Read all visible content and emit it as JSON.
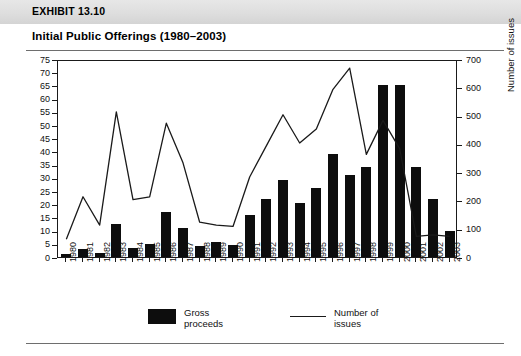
{
  "header": {
    "exhibit_label": "EXHIBIT 13.10",
    "title": "Initial Public Offerings (1980–2003)"
  },
  "legend": {
    "bars_label": "Gross proceeds",
    "bars_label_line1": "Gross",
    "bars_label_line2": "proceeds",
    "line_label": "Number of issues",
    "line_label_line1": "Number of",
    "line_label_line2": "issues",
    "bar_color": "#0d0d0d",
    "line_color": "#1a1a1a"
  },
  "footer": {
    "source": ""
  },
  "chart_data": {
    "type": "bar",
    "title": "Initial Public Offerings (1980–2003)",
    "xlabel": "",
    "ylabel": "Volumes ($ billions)",
    "y2label": "Number of issues",
    "ylim": [
      0,
      75
    ],
    "y2lim": [
      0,
      700
    ],
    "yticks": [
      0,
      5,
      10,
      15,
      20,
      25,
      30,
      35,
      40,
      45,
      50,
      55,
      60,
      65,
      70,
      75
    ],
    "y2ticks": [
      0,
      100,
      200,
      300,
      400,
      500,
      600,
      700
    ],
    "grid": false,
    "legend_position": "bottom",
    "categories": [
      "1980",
      "1981",
      "1982",
      "1983",
      "1984",
      "1985",
      "1986",
      "1987",
      "1988",
      "1989",
      "1990",
      "1991",
      "1992",
      "1993",
      "1994",
      "1995",
      "1996",
      "1997",
      "1998",
      "1999",
      "2000",
      "2001",
      "2002",
      "2003"
    ],
    "series": [
      {
        "name": "Gross proceeds",
        "type": "bar",
        "axis": "left",
        "unit": "$ billions",
        "values": [
          1,
          3,
          1.5,
          12.5,
          3.5,
          5,
          17,
          11,
          4,
          5.5,
          4.5,
          16,
          22,
          29,
          20.5,
          26,
          39,
          31,
          34,
          65,
          65,
          34,
          22,
          10
        ]
      },
      {
        "name": "Number of issues",
        "type": "line",
        "axis": "right",
        "unit": "issues",
        "values": [
          70,
          220,
          120,
          520,
          210,
          220,
          480,
          340,
          130,
          120,
          115,
          290,
          400,
          510,
          410,
          460,
          600,
          675,
          370,
          490,
          390,
          80,
          85,
          80
        ]
      }
    ]
  }
}
